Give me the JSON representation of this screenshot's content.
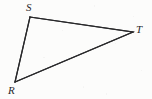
{
  "figure": {
    "kind": "geometry-triangle",
    "caption": "",
    "background_color": "#fcfcfb",
    "stroke_color": "#29292b",
    "stroke_width": 1.2,
    "label_color": "#29292b",
    "viewbox": {
      "width": 152,
      "height": 99
    },
    "vertices": [
      {
        "id": "S",
        "label": "S",
        "x": 30,
        "y": 17,
        "label_x": 26,
        "label_y": 2,
        "label_position": "above-left"
      },
      {
        "id": "T",
        "label": "T",
        "x": 133,
        "y": 32,
        "label_x": 136,
        "label_y": 24,
        "label_position": "above-right"
      },
      {
        "id": "R",
        "label": "R",
        "x": 15,
        "y": 82,
        "label_x": 8,
        "label_y": 85,
        "label_position": "below-left"
      }
    ],
    "edges": [
      {
        "id": "ST",
        "from": "S",
        "to": "T",
        "label": ""
      },
      {
        "id": "TR",
        "from": "T",
        "to": "R",
        "label": ""
      },
      {
        "id": "RS",
        "from": "R",
        "to": "S",
        "label": ""
      }
    ],
    "polygon_points": "30,17 133,32 15,82",
    "tick_marks": [],
    "angle_arcs": [],
    "right_angle_marks": []
  }
}
